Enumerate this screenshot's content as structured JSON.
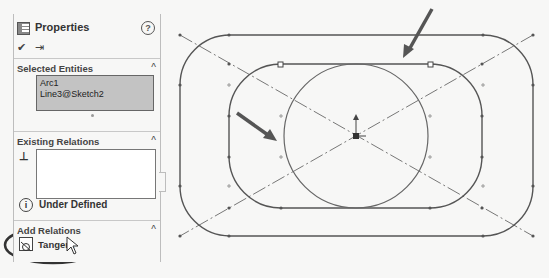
{
  "panel": {
    "title": "Properties",
    "icons": {
      "title": "property-manager-icon",
      "help": "help-icon",
      "ok": "checkmark-icon",
      "pin": "pushpin-icon"
    },
    "help_glyph": "?",
    "ok_glyph": "✔",
    "pin_glyph": "⇥",
    "selected_entities": {
      "title": "Selected Entities",
      "items": [
        "Arc1",
        "Line3@Sketch2"
      ]
    },
    "existing_relations": {
      "title": "Existing Relations",
      "items": []
    },
    "status": {
      "icon": "info-icon",
      "glyph": "i",
      "text": "Under Defined"
    },
    "add_relations": {
      "title": "Add Relations",
      "items": [
        {
          "label": "Tangent",
          "icon": "tangent-icon"
        }
      ]
    },
    "caret": "^"
  },
  "canvas": {
    "line_color": "#6a6a6a",
    "arrow_color": "#555555",
    "highlight_ellipse_color": "#333333",
    "outer_rect": {
      "x": 180,
      "y": 35,
      "w": 353,
      "h": 201,
      "r": 50
    },
    "inner_rect": {
      "x": 229,
      "y": 64,
      "w": 253,
      "h": 144,
      "r": 52
    },
    "circle": {
      "cx": 356,
      "cy": 136,
      "r": 72
    }
  }
}
